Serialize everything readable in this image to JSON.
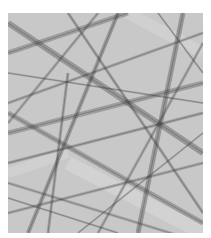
{
  "image": {
    "description": "Grayscale abstract pattern of intersecting diffuse bands and lines",
    "background_color": "#c8c8c8",
    "band_color": "#3a3a3a",
    "light_color": "#e4e4e4",
    "bands": [
      {
        "x1": 0,
        "y1": 10,
        "x2": 195,
        "y2": 140,
        "w": 6,
        "o": 0.35
      },
      {
        "x1": 0,
        "y1": 40,
        "x2": 120,
        "y2": 0,
        "w": 5,
        "o": 0.3
      },
      {
        "x1": 20,
        "y1": 220,
        "x2": 110,
        "y2": 0,
        "w": 4,
        "o": 0.35
      },
      {
        "x1": 0,
        "y1": 120,
        "x2": 195,
        "y2": 70,
        "w": 5,
        "o": 0.3
      },
      {
        "x1": 60,
        "y1": 0,
        "x2": 195,
        "y2": 200,
        "w": 3,
        "o": 0.3
      },
      {
        "x1": 0,
        "y1": 150,
        "x2": 195,
        "y2": 100,
        "w": 3,
        "o": 0.28
      },
      {
        "x1": 130,
        "y1": 220,
        "x2": 175,
        "y2": 0,
        "w": 5,
        "o": 0.35
      },
      {
        "x1": 0,
        "y1": 90,
        "x2": 195,
        "y2": 20,
        "w": 3,
        "o": 0.25
      },
      {
        "x1": 0,
        "y1": 200,
        "x2": 195,
        "y2": 150,
        "w": 3,
        "o": 0.25
      },
      {
        "x1": 0,
        "y1": 100,
        "x2": 195,
        "y2": 210,
        "w": 5,
        "o": 0.3
      },
      {
        "x1": 40,
        "y1": 220,
        "x2": 60,
        "y2": 60,
        "w": 3,
        "o": 0.28
      },
      {
        "x1": 0,
        "y1": 170,
        "x2": 195,
        "y2": 230,
        "w": 3,
        "o": 0.22
      },
      {
        "x1": 90,
        "y1": 0,
        "x2": 0,
        "y2": 110,
        "w": 3,
        "o": 0.25
      },
      {
        "x1": 195,
        "y1": 30,
        "x2": 90,
        "y2": 220,
        "w": 3,
        "o": 0.25
      },
      {
        "x1": 0,
        "y1": 60,
        "x2": 195,
        "y2": 90,
        "w": 2,
        "o": 0.22
      },
      {
        "x1": 150,
        "y1": 0,
        "x2": 195,
        "y2": 60,
        "w": 2,
        "o": 0.25
      },
      {
        "x1": 0,
        "y1": 185,
        "x2": 110,
        "y2": 220,
        "w": 2,
        "o": 0.22
      },
      {
        "x1": 70,
        "y1": 220,
        "x2": 195,
        "y2": 120,
        "w": 2,
        "o": 0.22
      }
    ],
    "light_bands": [
      {
        "x1": 60,
        "y1": 150,
        "x2": 195,
        "y2": 220,
        "w": 14,
        "o": 0.35
      },
      {
        "x1": 0,
        "y1": 160,
        "x2": 60,
        "y2": 140,
        "w": 10,
        "o": 0.3
      },
      {
        "x1": 120,
        "y1": 0,
        "x2": 195,
        "y2": 40,
        "w": 12,
        "o": 0.3
      }
    ]
  }
}
